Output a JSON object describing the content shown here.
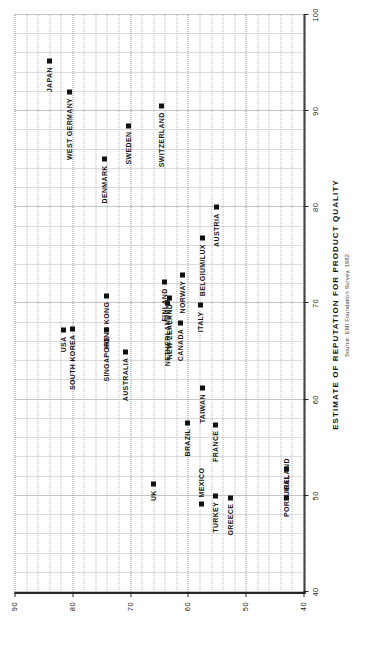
{
  "chart_data": {
    "type": "scatter",
    "title": "",
    "xlabel": "ESTIMATE OF REPUTATION FOR PRODUCT QUALITY",
    "ylabel": "ESTIMATE OF REPUTATION FOR MARKETING PUSH",
    "source": "Source: EMI Foundation Survey, 1982.",
    "xlim": [
      40,
      100
    ],
    "ylim": [
      40,
      90
    ],
    "xticks": [
      40,
      50,
      60,
      70,
      80,
      90,
      100
    ],
    "yticks": [
      40,
      50,
      60,
      70,
      80,
      90
    ],
    "xtick_labels": [
      "40",
      "50",
      "60",
      "70",
      "80",
      "90",
      "100"
    ],
    "ytick_labels": [
      "40",
      "50",
      "60",
      "70",
      "80",
      "90"
    ],
    "grid": true,
    "minor_grid": true,
    "legend": "none",
    "marker": "filled-square",
    "marker_color": "#111111",
    "points": [
      {
        "label": "JAPAN",
        "x": 95.2,
        "y": 84.0,
        "pos": "left"
      },
      {
        "label": "WEST GERMANY",
        "x": 92.0,
        "y": 80.5,
        "pos": "left"
      },
      {
        "label": "SWITZERLAND",
        "x": 90.5,
        "y": 64.5,
        "pos": "left"
      },
      {
        "label": "SWEDEN",
        "x": 88.5,
        "y": 70.2,
        "pos": "left"
      },
      {
        "label": "DENMARK",
        "x": 85.0,
        "y": 74.5,
        "pos": "left"
      },
      {
        "label": "AUSTRIA",
        "x": 80.0,
        "y": 55.0,
        "pos": "left"
      },
      {
        "label": "BELGIUM/LUX",
        "x": 76.8,
        "y": 57.5,
        "pos": "left"
      },
      {
        "label": "NORWAY",
        "x": 73.0,
        "y": 61.0,
        "pos": "left"
      },
      {
        "label": "FINLAND",
        "x": 72.2,
        "y": 64.0,
        "pos": "left"
      },
      {
        "label": "NEW ZEALAND",
        "x": 70.6,
        "y": 63.2,
        "pos": "left"
      },
      {
        "label": "NETHERLANDS",
        "x": 70.0,
        "y": 63.6,
        "pos": "left"
      },
      {
        "label": "ITALY",
        "x": 69.8,
        "y": 57.8,
        "pos": "left"
      },
      {
        "label": "HONG KONG",
        "x": 70.8,
        "y": 74.0,
        "pos": "left"
      },
      {
        "label": "SOUTH KOREA",
        "x": 67.4,
        "y": 80.0,
        "pos": "left"
      },
      {
        "label": "USA",
        "x": 67.2,
        "y": 81.5,
        "pos": "left"
      },
      {
        "label": "SINGAPORE",
        "x": 67.2,
        "y": 74.0,
        "pos": "left"
      },
      {
        "label": "CANADA",
        "x": 68.0,
        "y": 61.2,
        "pos": "left"
      },
      {
        "label": "AUSTRALIA",
        "x": 65.0,
        "y": 70.8,
        "pos": "left"
      },
      {
        "label": "TAIWAN",
        "x": 61.2,
        "y": 57.5,
        "pos": "left"
      },
      {
        "label": "BRAZIL",
        "x": 57.6,
        "y": 60.0,
        "pos": "left"
      },
      {
        "label": "FRANCE",
        "x": 57.4,
        "y": 55.2,
        "pos": "left"
      },
      {
        "label": "UK",
        "x": 51.2,
        "y": 66.0,
        "pos": "left"
      },
      {
        "label": "TURKEY",
        "x": 50.0,
        "y": 55.2,
        "pos": "left"
      },
      {
        "label": "GREECE",
        "x": 49.8,
        "y": 52.7,
        "pos": "left"
      },
      {
        "label": "MEXICO",
        "x": 49.2,
        "y": 57.6,
        "pos": "right"
      },
      {
        "label": "PORTUGAL",
        "x": 52.8,
        "y": 43.0,
        "pos": "left"
      },
      {
        "label": "IRELAND",
        "x": 49.8,
        "y": 43.0,
        "pos": "right"
      }
    ]
  }
}
